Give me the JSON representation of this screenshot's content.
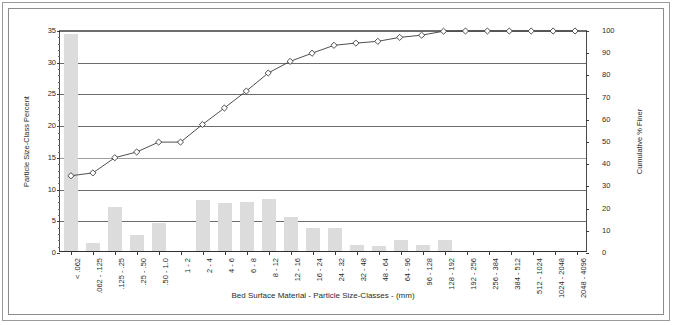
{
  "chart_data": {
    "type": "bar",
    "title": "",
    "xlabel": "Bed Surface Material  -  Particle Size-Classes  - (mm)",
    "ylabel": "Particle Size-Class Percent",
    "y2label": "Cumulative % Finer",
    "grid": true,
    "legend": "none",
    "ylim": [
      0,
      35
    ],
    "y2lim": [
      0,
      100
    ],
    "yticks": [
      0,
      5,
      10,
      15,
      20,
      25,
      30,
      35
    ],
    "y2ticks": [
      0,
      10,
      20,
      30,
      40,
      50,
      60,
      70,
      80,
      90,
      100
    ],
    "categories": [
      "< .062",
      ".062 - .125",
      ".125 - .25",
      ".25 - .50",
      ".50 - 1.0",
      "1 - 2",
      "2 - 4",
      "4 - 6",
      "6 - 8",
      "8 - 12",
      "12 - 16",
      "16 - 24",
      "24 - 32",
      "32 - 48",
      "48 - 64",
      "64 - 96",
      "96 - 128",
      "128 - 192",
      "192 - 256",
      "256 - 384",
      "384 - 512",
      "512 - 1024",
      "1024 - 2048",
      "2048 - 4096"
    ],
    "series": [
      {
        "name": "Particle Size-Class Percent",
        "type": "bar",
        "axis": "left",
        "color": "#dcdcdc",
        "values": [
          34.2,
          1.3,
          6.9,
          2.6,
          4.5,
          0.0,
          8.0,
          7.5,
          7.7,
          8.2,
          5.3,
          3.7,
          3.6,
          1.0,
          0.8,
          1.8,
          1.0,
          1.8,
          0.0,
          0.0,
          0.0,
          0.0,
          0.0,
          0.0
        ]
      },
      {
        "name": "Cumulative % Finer",
        "type": "line",
        "axis": "right",
        "color": "#3a3a3a",
        "marker": "diamond",
        "values": [
          34.2,
          35.5,
          42.4,
          45.0,
          49.5,
          49.5,
          57.5,
          65.0,
          72.7,
          80.9,
          86.2,
          89.9,
          93.5,
          94.5,
          95.3,
          97.1,
          98.1,
          99.9,
          100.0,
          100.0,
          100.0,
          100.0,
          100.0,
          100.0
        ]
      }
    ]
  },
  "figure": {
    "frame": "double-border",
    "background": "#ffffff"
  }
}
